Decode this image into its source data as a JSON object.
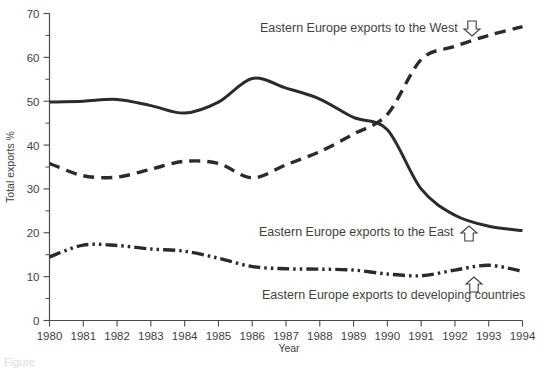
{
  "chart_data": {
    "type": "line",
    "title": "",
    "xlabel": "Year",
    "ylabel": "Total exports %",
    "xlim": [
      1980,
      1994
    ],
    "ylim": [
      0,
      70
    ],
    "ytick_step": 10,
    "yminor_step": 5,
    "grid": false,
    "legend": "inline-annotations",
    "x": [
      1980,
      1981,
      1982,
      1983,
      1984,
      1985,
      1986,
      1987,
      1988,
      1989,
      1990,
      1991,
      1992,
      1993,
      1994
    ],
    "yticks": [
      0,
      10,
      20,
      30,
      40,
      50,
      60,
      70
    ],
    "xticks": [
      "1980",
      "1981",
      "1982",
      "1983",
      "1984",
      "1985",
      "1986",
      "1987",
      "1988",
      "1989",
      "1990",
      "1991",
      "1992",
      "1993",
      "1994"
    ],
    "series": [
      {
        "name": "Eastern Europe exports to the East",
        "style": "solid",
        "values": [
          49.8,
          50.0,
          50.4,
          49.0,
          47.3,
          49.8,
          55.2,
          53.0,
          50.5,
          46.3,
          43.5,
          30.0,
          24.0,
          21.5,
          20.5
        ]
      },
      {
        "name": "Eastern Europe exports to the West",
        "style": "dashed",
        "values": [
          35.8,
          33.0,
          32.7,
          34.5,
          36.3,
          35.8,
          32.5,
          35.5,
          38.5,
          42.5,
          47.0,
          59.5,
          62.5,
          65.0,
          67.0
        ]
      },
      {
        "name": "Eastern Europe exports to developing countries",
        "style": "dashdot",
        "values": [
          14.5,
          17.2,
          17.1,
          16.3,
          15.8,
          14.2,
          12.3,
          11.8,
          11.7,
          11.5,
          10.6,
          10.2,
          11.5,
          12.6,
          11.2
        ]
      }
    ],
    "annotations": [
      {
        "id": "west",
        "text": "Eastern Europe exports to the West",
        "arrow": "down",
        "text_x": 260,
        "text_y": 32,
        "arrow_x": 472,
        "arrow_y": 21
      },
      {
        "id": "east",
        "text": "Eastern Europe exports to the East",
        "arrow": "up",
        "text_x": 259,
        "text_y": 236,
        "arrow_x": 469,
        "arrow_y": 226
      },
      {
        "id": "developing",
        "text": "Eastern Europe exports to developing countries",
        "arrow": "up",
        "text_x": 262,
        "text_y": 299,
        "arrow_x": 474,
        "arrow_y": 277
      }
    ]
  },
  "caption": {
    "text": "Figure"
  }
}
